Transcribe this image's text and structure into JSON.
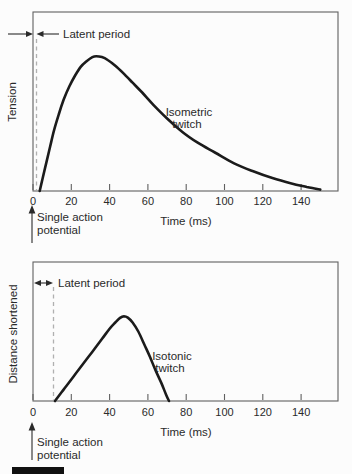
{
  "figure": {
    "background_color": "#fcfcfc",
    "ink_color": "#2a2a2a",
    "curve_color": "#1b1b1b",
    "axis_color": "#606060",
    "dash_color": "#b0b0b0",
    "figure_bar_color": "#111111"
  },
  "chart_data": [
    {
      "type": "line",
      "name": "isometric-twitch",
      "ylabel": "Tension",
      "xlabel": "Time (ms)",
      "x_ticks": [
        0,
        20,
        40,
        60,
        80,
        100,
        120,
        140
      ],
      "xlim": [
        0,
        159
      ],
      "ylim": [
        0,
        1
      ],
      "grid": false,
      "legend": "none",
      "curve_label": [
        "Isometric",
        "twitch"
      ],
      "annotations": {
        "latent_period_label": "Latent period",
        "stimulus_label": [
          "Single action",
          "potential"
        ]
      },
      "series": [
        {
          "name": "tension",
          "x": [
            3.5,
            5,
            7,
            9,
            11,
            13.5,
            16,
            19,
            22,
            25,
            28,
            31,
            33,
            36,
            39,
            43,
            47,
            52,
            57,
            63,
            70,
            78,
            86,
            95,
            105,
            115,
            125,
            135,
            143,
            150
          ],
          "y": [
            0,
            0.07,
            0.16,
            0.25,
            0.34,
            0.43,
            0.51,
            0.585,
            0.645,
            0.695,
            0.725,
            0.748,
            0.753,
            0.748,
            0.732,
            0.7,
            0.66,
            0.605,
            0.55,
            0.48,
            0.405,
            0.33,
            0.27,
            0.215,
            0.155,
            0.11,
            0.072,
            0.042,
            0.022,
            0.008
          ]
        }
      ]
    },
    {
      "type": "line",
      "name": "isotonic-twitch",
      "ylabel": "Distance shortened",
      "xlabel": "Time (ms)",
      "x_ticks": [
        0,
        20,
        40,
        60,
        80,
        100,
        120,
        140
      ],
      "xlim": [
        0,
        159
      ],
      "ylim": [
        0,
        1
      ],
      "grid": false,
      "legend": "none",
      "curve_label": [
        "Isotonic",
        "twitch"
      ],
      "annotations": {
        "latent_period_label": "Latent period",
        "stimulus_label": [
          "Single action",
          "potential"
        ]
      },
      "series": [
        {
          "name": "distance",
          "x": [
            11.5,
            16,
            21,
            26,
            31,
            36,
            40,
            43,
            45.5,
            47.5,
            49.5,
            52,
            55,
            58,
            61,
            64,
            67,
            69.5,
            71
          ],
          "y": [
            0,
            0.082,
            0.173,
            0.264,
            0.355,
            0.446,
            0.52,
            0.565,
            0.598,
            0.61,
            0.6,
            0.565,
            0.5,
            0.41,
            0.32,
            0.22,
            0.13,
            0.045,
            0
          ]
        }
      ]
    }
  ]
}
